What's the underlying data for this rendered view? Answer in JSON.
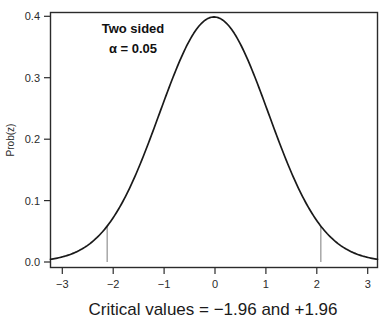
{
  "chart_data": {
    "type": "line",
    "title": "",
    "subtitle": "",
    "xlabel": "Critical values = −1.96 and +1.96",
    "ylabel": "Prob(z)",
    "xlim": [
      -3,
      3
    ],
    "ylim": [
      0.0,
      0.4
    ],
    "grid": false,
    "legend": "none",
    "frame": "box",
    "series": [
      {
        "name": "Standard normal density",
        "formula": "phi(z) = (1/sqrt(2*pi)) * exp(-z^2/2)",
        "color": "#1a1a1a",
        "x": [
          -3.0,
          -2.8,
          -2.6,
          -2.4,
          -2.2,
          -2.0,
          -1.96,
          -1.8,
          -1.6,
          -1.4,
          -1.2,
          -1.0,
          -0.8,
          -0.6,
          -0.4,
          -0.2,
          0.0,
          0.2,
          0.4,
          0.6,
          0.8,
          1.0,
          1.2,
          1.4,
          1.6,
          1.8,
          1.96,
          2.0,
          2.2,
          2.4,
          2.6,
          2.8,
          3.0
        ],
        "y": [
          0.0044,
          0.0079,
          0.0136,
          0.0224,
          0.0355,
          0.054,
          0.0584,
          0.079,
          0.1109,
          0.1497,
          0.1942,
          0.242,
          0.2897,
          0.3332,
          0.3683,
          0.391,
          0.3989,
          0.391,
          0.3683,
          0.3332,
          0.2897,
          0.242,
          0.1942,
          0.1497,
          0.1109,
          0.079,
          0.0584,
          0.054,
          0.0355,
          0.0224,
          0.0136,
          0.0079,
          0.0044
        ]
      }
    ],
    "x_ticks": [
      -3,
      -2,
      -1,
      0,
      1,
      2,
      3
    ],
    "x_tick_labels": [
      "−3",
      "−2",
      "−1",
      "0",
      "1",
      "2",
      "3"
    ],
    "y_ticks": [
      0.0,
      0.1,
      0.2,
      0.3,
      0.4
    ],
    "y_tick_labels": [
      "0.0",
      "0.1",
      "0.2",
      "0.3",
      "0.4"
    ],
    "annotations": [
      {
        "name": "two-sided-label",
        "text": "Two sided",
        "x": -1.9,
        "y": 0.372
      },
      {
        "name": "alpha-label",
        "text": "α = 0.05",
        "x": -1.9,
        "y": 0.341
      }
    ],
    "vertical_markers": [
      {
        "name": "critical-value-lower",
        "x": -1.96,
        "y_top": 0.0584,
        "label": "−1.96",
        "color": "#9a9a9a"
      },
      {
        "name": "critical-value-upper",
        "x": 1.96,
        "y_top": 0.0584,
        "label": "+1.96",
        "color": "#9a9a9a"
      }
    ],
    "colors": {
      "curve": "#1a1a1a",
      "frame": "#2b2b2b",
      "marker": "#9a9a9a",
      "background": "#ffffff",
      "text": "#1a1a1a"
    }
  },
  "figure": {
    "caption": "Critical values = −1.96 and +1.96",
    "y_axis_title": "Prob(z)",
    "annotation_line1": "Two sided",
    "annotation_line2": "α = 0.05",
    "x_tick_labels": {
      "t0": "−3",
      "t1": "−2",
      "t2": "−1",
      "t3": "0",
      "t4": "1",
      "t5": "2",
      "t6": "3"
    },
    "y_tick_labels": {
      "t0": "0.0",
      "t1": "0.1",
      "t2": "0.2",
      "t3": "0.3",
      "t4": "0.4"
    }
  }
}
